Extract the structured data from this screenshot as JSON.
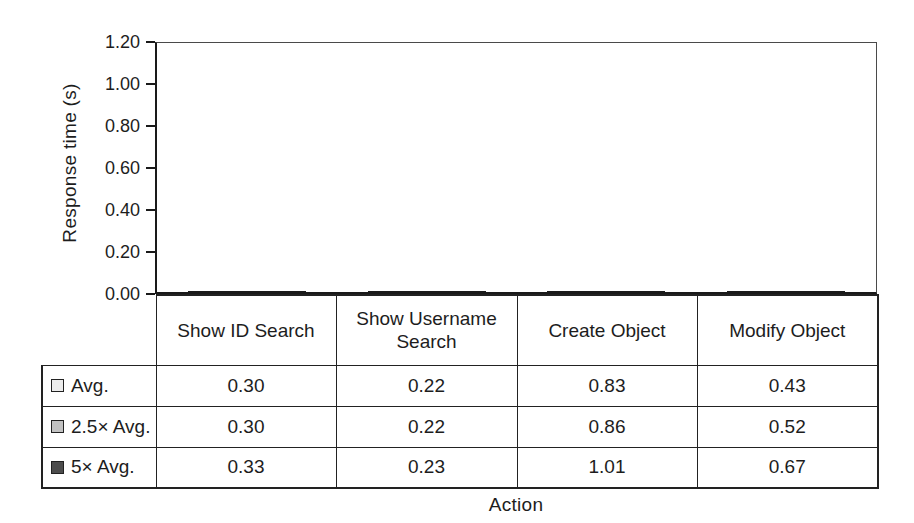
{
  "figure": {
    "background_color": "#ffffff",
    "text_color": "#1d1d1d"
  },
  "chart_data": {
    "type": "bar",
    "title": "",
    "xlabel": "Action",
    "ylabel": "Response time (s)",
    "ylim": [
      0,
      1.2
    ],
    "ytick_labels": [
      "0.00",
      "0.20",
      "0.40",
      "0.60",
      "0.80",
      "1.00",
      "1.20"
    ],
    "grid": false,
    "legend_position": "table-left-column",
    "bar_border_color": "#1a1a1a",
    "categories": [
      "Show ID Search",
      "Show Username Search",
      "Create Object",
      "Modify Object"
    ],
    "series": [
      {
        "name": "Avg.",
        "color": "#ececec",
        "values": [
          0.3,
          0.22,
          0.83,
          0.43
        ]
      },
      {
        "name": "2.5× Avg.",
        "color": "#c2c2c2",
        "values": [
          0.3,
          0.22,
          0.86,
          0.52
        ]
      },
      {
        "name": "5× Avg.",
        "color": "#4d4d4d",
        "values": [
          0.33,
          0.23,
          1.01,
          0.67
        ]
      }
    ]
  }
}
